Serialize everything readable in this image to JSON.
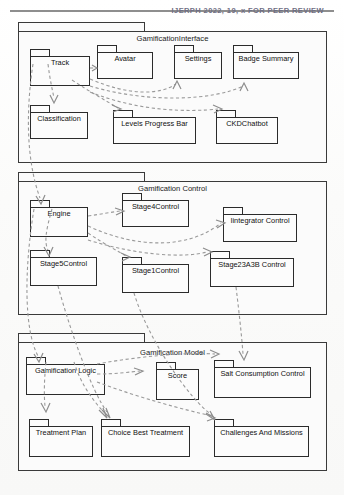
{
  "page": {
    "header_text": "IJERPH 2022, 19, x FOR PEER REVIEW"
  },
  "diagram": {
    "type": "uml-package-diagram",
    "colors": {
      "border": "#3a3a3a",
      "node_border": "#2b2b2b",
      "link": "#9a9a9a",
      "background": "#fbfbfb",
      "text": "#111111"
    },
    "packages": [
      {
        "id": "gamification-interface",
        "title": "GamificationInterface",
        "nodes": [
          {
            "id": "track",
            "label": "Track"
          },
          {
            "id": "avatar",
            "label": "Avatar"
          },
          {
            "id": "settings",
            "label": "Settings"
          },
          {
            "id": "badge-summary",
            "label": "Badge Summary"
          },
          {
            "id": "classification",
            "label": "Classification"
          },
          {
            "id": "levels-progress-bar",
            "label": "Levels Progress Bar"
          },
          {
            "id": "ckdchatbot",
            "label": "CKDChatbot"
          }
        ]
      },
      {
        "id": "gamification-control",
        "title": "Gamification Control",
        "nodes": [
          {
            "id": "engine",
            "label": "Engine"
          },
          {
            "id": "stage4control",
            "label": "Stage4Control"
          },
          {
            "id": "iintegrator-control",
            "label": "Iintegrator Control"
          },
          {
            "id": "stage5control",
            "label": "Stage5Control"
          },
          {
            "id": "stage1control",
            "label": "Stage1Control"
          },
          {
            "id": "stage23a3b-control",
            "label": "Stage23A3B Control"
          }
        ]
      },
      {
        "id": "gamification-model",
        "title": "Gamification Model",
        "nodes": [
          {
            "id": "gamification-logic",
            "label": "Gamification Logic"
          },
          {
            "id": "score",
            "label": "Score"
          },
          {
            "id": "salt-consumption-control",
            "label": "Salt Consumption Control"
          },
          {
            "id": "treatment-plan",
            "label": "Treatment Plan"
          },
          {
            "id": "choice-best-treatment",
            "label": "Choice Best Treatment"
          },
          {
            "id": "challenges-and-missions",
            "label": "Challenges And Missions"
          }
        ]
      }
    ],
    "dependencies": [
      {
        "from": "track",
        "to": "avatar"
      },
      {
        "from": "track",
        "to": "settings"
      },
      {
        "from": "track",
        "to": "badge-summary"
      },
      {
        "from": "track",
        "to": "classification"
      },
      {
        "from": "track",
        "to": "levels-progress-bar"
      },
      {
        "from": "track",
        "to": "ckdchatbot"
      },
      {
        "from": "track",
        "to": "engine"
      },
      {
        "from": "engine",
        "to": "stage4control"
      },
      {
        "from": "engine",
        "to": "iintegrator-control"
      },
      {
        "from": "engine",
        "to": "stage5control"
      },
      {
        "from": "engine",
        "to": "stage1control"
      },
      {
        "from": "engine",
        "to": "stage23a3b-control"
      },
      {
        "from": "engine",
        "to": "gamification-logic"
      },
      {
        "from": "stage5control",
        "to": "choice-best-treatment"
      },
      {
        "from": "stage1control",
        "to": "challenges-and-missions"
      },
      {
        "from": "stage23a3b-control",
        "to": "salt-consumption-control"
      },
      {
        "from": "gamification-logic",
        "to": "score"
      },
      {
        "from": "gamification-logic",
        "to": "salt-consumption-control"
      },
      {
        "from": "gamification-logic",
        "to": "treatment-plan"
      },
      {
        "from": "gamification-logic",
        "to": "choice-best-treatment"
      },
      {
        "from": "gamification-logic",
        "to": "challenges-and-missions"
      }
    ]
  }
}
